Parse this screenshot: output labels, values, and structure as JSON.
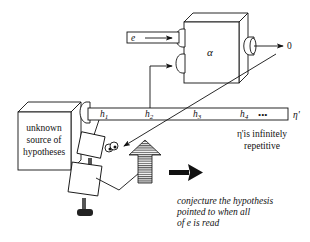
{
  "diagram": {
    "source_box": {
      "lines": [
        "unknown",
        "source of",
        "hypotheses"
      ]
    },
    "machine": {
      "label": "α",
      "input_label": "e",
      "output_label": "0"
    },
    "tape": {
      "cells": [
        {
          "base": "h",
          "sub": "1"
        },
        {
          "base": "h",
          "sub": "2"
        },
        {
          "base": "h",
          "sub": "3"
        },
        {
          "base": "h",
          "sub": "4"
        }
      ],
      "ellipsis": "•••",
      "end_label": "η'"
    },
    "tape_note": {
      "lines": [
        "η'is infinitely",
        "repetitive"
      ]
    },
    "caption": {
      "lines": [
        "conjecture the hypothesis",
        "pointed to when all",
        "of e is read"
      ]
    },
    "colors": {
      "ink": "#111111",
      "background": "#ffffff",
      "hatch": "#555555"
    }
  }
}
